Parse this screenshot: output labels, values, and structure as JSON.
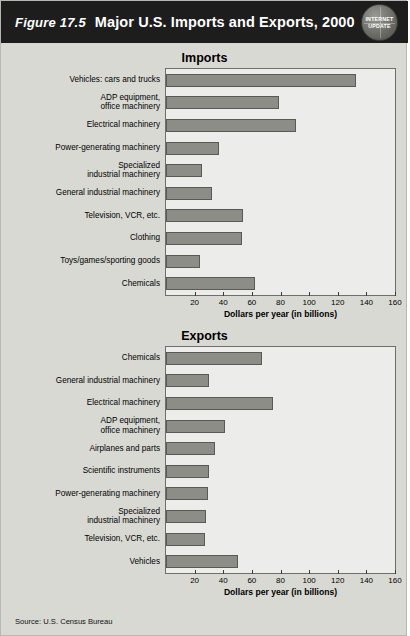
{
  "header": {
    "figure_number": "Figure 17.5",
    "title": "Major U.S. Imports and Exports, 2000",
    "badge_line1": "INTERNET",
    "badge_line2": "UPDATE"
  },
  "source": "Source: U.S. Census Bureau",
  "chart_data": [
    {
      "type": "bar",
      "orientation": "horizontal",
      "title": "Imports",
      "xlabel": "Dollars per year (in billions)",
      "ylabel": "",
      "xlim": [
        0,
        160
      ],
      "xticks": [
        20,
        40,
        60,
        80,
        100,
        120,
        140,
        160
      ],
      "grid": false,
      "categories": [
        "Vehicles: cars and trucks",
        "ADP equipment,\noffice machinery",
        "Electrical machinery",
        "Power-generating machinery",
        "Specialized\nindustrial machinery",
        "General industrial machinery",
        "Television, VCR, etc.",
        "Clothing",
        "Toys/games/sporting goods",
        "Chemicals"
      ],
      "values": [
        133,
        79,
        91,
        37,
        25,
        32,
        54,
        53,
        24,
        62
      ]
    },
    {
      "type": "bar",
      "orientation": "horizontal",
      "title": "Exports",
      "xlabel": "Dollars per year (in billions)",
      "ylabel": "",
      "xlim": [
        0,
        160
      ],
      "xticks": [
        20,
        40,
        60,
        80,
        100,
        120,
        140,
        160
      ],
      "grid": false,
      "categories": [
        "Chemicals",
        "General industrial machinery",
        "Electrical machinery",
        "ADP equipment,\noffice machinery",
        "Airplanes and parts",
        "Scientific instruments",
        "Power-generating machinery",
        "Specialized\nindustrial machinery",
        "Television, VCR, etc.",
        "Vehicles"
      ],
      "values": [
        67,
        30,
        75,
        41,
        34,
        30,
        29,
        28,
        27,
        50
      ]
    }
  ]
}
